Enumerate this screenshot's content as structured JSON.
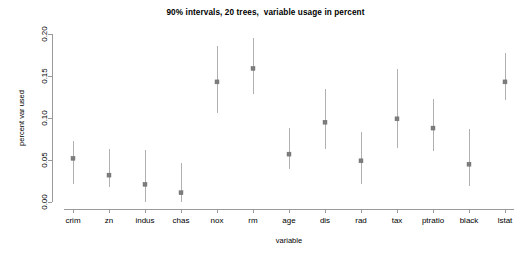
{
  "chart_data": {
    "type": "scatter",
    "title": "90% intervals, 20 trees,  variable usage in percent",
    "xlabel": "variable",
    "ylabel": "percent var used",
    "categories": [
      "crim",
      "zn",
      "indus",
      "chas",
      "nox",
      "rm",
      "age",
      "dis",
      "rad",
      "tax",
      "ptratio",
      "black",
      "lstat"
    ],
    "values": [
      0.052,
      0.032,
      0.021,
      0.011,
      0.143,
      0.159,
      0.057,
      0.095,
      0.049,
      0.099,
      0.088,
      0.045,
      0.143
    ],
    "lower": [
      0.022,
      0.018,
      0.0,
      0.0,
      0.106,
      0.129,
      0.039,
      0.063,
      0.021,
      0.064,
      0.061,
      0.019,
      0.121
    ],
    "upper": [
      0.073,
      0.063,
      0.062,
      0.046,
      0.186,
      0.195,
      0.088,
      0.134,
      0.083,
      0.158,
      0.123,
      0.087,
      0.177
    ],
    "ylim": [
      0.0,
      0.2
    ],
    "yticks": [
      0.0,
      0.05,
      0.1,
      0.15,
      0.2
    ],
    "ytick_labels": [
      "0.00",
      "0.05",
      "0.10",
      "0.15",
      "0.20"
    ],
    "grid": false,
    "legend": "none",
    "series_name": "percent var used",
    "colors": {
      "point": "#7d7d7d",
      "interval": "#b0b0b0",
      "axis": "#9a9a9a",
      "text": "#000000",
      "background": "#ffffff"
    }
  }
}
